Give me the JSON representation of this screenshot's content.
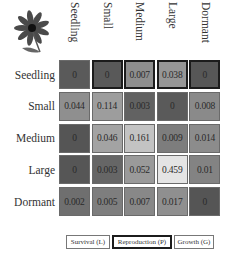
{
  "chart_data": {
    "type": "heatmap",
    "title": "",
    "row_labels": [
      "Seedling",
      "Small",
      "Medium",
      "Large",
      "Dormant"
    ],
    "col_labels": [
      "Seedling",
      "Small",
      "Medium",
      "Large",
      "Dormant"
    ],
    "values": [
      [
        0,
        0,
        0.007,
        0.038,
        0
      ],
      [
        0.044,
        0.114,
        0.003,
        0,
        0.008
      ],
      [
        0,
        0.046,
        0.161,
        0.009,
        0.014
      ],
      [
        0,
        0.003,
        0.052,
        0.459,
        0.01
      ],
      [
        0.002,
        0.005,
        0.007,
        0.017,
        0
      ]
    ],
    "display_values": [
      [
        "0",
        "0",
        "0.007",
        "0.038",
        "0"
      ],
      [
        "0.044",
        "0.114",
        "0.003",
        "0",
        "0.008"
      ],
      [
        "0",
        "0.046",
        "0.161",
        "0.009",
        "0.014"
      ],
      [
        "0",
        "0.003",
        "0.052",
        "0.459",
        "0.01"
      ],
      [
        "0.002",
        "0.005",
        "0.007",
        "0.017",
        "0"
      ]
    ],
    "cell_types": [
      [
        "survival",
        "repro",
        "repro",
        "repro",
        "repro"
      ],
      [
        "growth",
        "growth",
        "growth",
        "growth",
        "growth"
      ],
      [
        "growth",
        "growth",
        "growth",
        "growth",
        "growth"
      ],
      [
        "growth",
        "growth",
        "growth",
        "growth",
        "growth"
      ],
      [
        "growth",
        "growth",
        "growth",
        "growth",
        "growth"
      ]
    ],
    "cell_colors": [
      [
        "#5a5a5a",
        "#595959",
        "#8e8e8e",
        "#969696",
        "#575757"
      ],
      [
        "#8f8f8f",
        "#9d9d9d",
        "#626262",
        "#5a5a5a",
        "#8a8a8a"
      ],
      [
        "#555555",
        "#a3a3a3",
        "#c3c3c3",
        "#7d7d7d",
        "#8c8c8c"
      ],
      [
        "#565656",
        "#666666",
        "#9a9a9a",
        "#e4e4e4",
        "#838383"
      ],
      [
        "#6f6f6f",
        "#7e7e7e",
        "#888888",
        "#8f8f8f",
        "#555555"
      ]
    ],
    "legend": [
      {
        "key": "survival",
        "label": "Survival (L)"
      },
      {
        "key": "repro",
        "label": "Reproduction (P)"
      },
      {
        "key": "growth",
        "label": "Growth (G)"
      }
    ],
    "colorscale": "grayscale (dark = low, light = high)"
  },
  "icon": "flower-icon"
}
